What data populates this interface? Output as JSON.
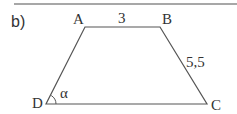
{
  "figure": {
    "part_label": "b)",
    "shape": "trapezoid",
    "vertices": {
      "A": {
        "label": "A",
        "x": 85,
        "y": 27
      },
      "B": {
        "label": "B",
        "x": 160,
        "y": 27
      },
      "C": {
        "label": "C",
        "x": 207,
        "y": 104
      },
      "D": {
        "label": "D",
        "x": 46,
        "y": 104
      }
    },
    "side_labels": {
      "AB": "3",
      "BC": "5,5"
    },
    "angle_label": "α",
    "colors": {
      "line": "#555555",
      "text": "#333333",
      "rule": "#888888"
    }
  }
}
